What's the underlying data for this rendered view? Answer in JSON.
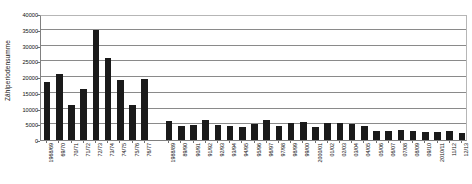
{
  "chart_data": {
    "type": "bar",
    "title": "",
    "xlabel": "",
    "ylabel": "Zählperiodensumme",
    "ylim": [
      0,
      40000
    ],
    "ytick_step": 5000,
    "yticks": [
      0,
      5000,
      10000,
      15000,
      20000,
      25000,
      30000,
      35000,
      40000
    ],
    "ytick_labels": [
      "0",
      "5000",
      "10000",
      "15000",
      "20000",
      "25000",
      "30000",
      "35000",
      "40000"
    ],
    "grid": true,
    "legend": "none",
    "bar_color": "#1a1a1a",
    "gridline_color": "#8a8a8a",
    "axis_color": "#808080",
    "categories": [
      "1968/69",
      "69/70",
      "70/71",
      "71/72",
      "72/73",
      "73/74",
      "74/75",
      "75/76",
      "76/77",
      "",
      "1988/89",
      "89/90",
      "90/91",
      "91/92",
      "92/93",
      "93/94",
      "94/95",
      "95/96",
      "96/97",
      "97/98",
      "98/99",
      "99/00",
      "2000/01",
      "01/02",
      "02/03",
      "03/04",
      "04/05",
      "05/06",
      "06/07",
      "07/08",
      "08/09",
      "09/10",
      "2010/11",
      "11/12",
      "12/13"
    ],
    "values": [
      18300,
      21000,
      11200,
      16100,
      35000,
      26000,
      19000,
      11100,
      19400,
      null,
      6100,
      4600,
      4700,
      6500,
      4700,
      4500,
      4100,
      5200,
      6300,
      4600,
      5400,
      5800,
      4200,
      5400,
      5500,
      5100,
      4300,
      3000,
      2900,
      3100,
      2900,
      2500,
      2400,
      3000,
      2300
    ]
  }
}
